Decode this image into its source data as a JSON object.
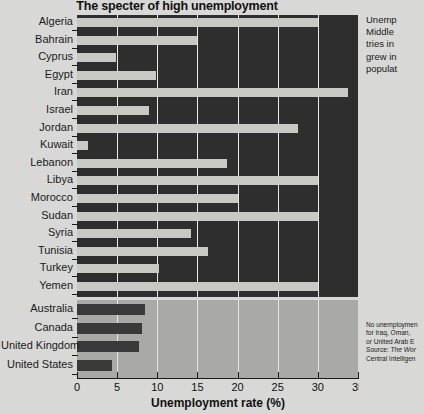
{
  "chart_data": {
    "type": "bar",
    "orientation": "horizontal",
    "title": "The specter of high unemployment",
    "xlabel": "Unemployment rate (%)",
    "ylabel": "",
    "xlim": [
      0,
      35
    ],
    "xticks": [
      0,
      5,
      10,
      15,
      20,
      25,
      30,
      35
    ],
    "xtick_labels": [
      "0",
      "5",
      "10",
      "15",
      "20",
      "25",
      "30",
      "35"
    ],
    "grid": true,
    "legend": "none",
    "panels": [
      {
        "name": "middle-east-north-africa",
        "background": "#2e2e2e",
        "bar_color": "#c9c9c4",
        "categories": [
          "Algeria",
          "Bahrain",
          "Cyprus",
          "Egypt",
          "Iran",
          "Israel",
          "Jordan",
          "Kuwait",
          "Lebanon",
          "Libya",
          "Morocco",
          "Sudan",
          "Syria",
          "Tunisia",
          "Turkey",
          "Yemen"
        ],
        "values": [
          30.0,
          15.0,
          4.8,
          9.8,
          33.8,
          9.0,
          27.5,
          1.4,
          18.7,
          30.0,
          20.0,
          30.0,
          14.2,
          16.3,
          10.2,
          30.0
        ]
      },
      {
        "name": "comparison-countries",
        "background": "#a9a9a7",
        "bar_color": "#3a3a3a",
        "categories": [
          "Australia",
          "Canada",
          "United Kingdom",
          "United States"
        ],
        "values": [
          8.5,
          8.1,
          7.7,
          4.4
        ]
      }
    ]
  },
  "side_note": {
    "lines": [
      "Unemp",
      "Middle",
      "tries in",
      "grew in",
      "populat"
    ]
  },
  "footnote": {
    "lines": [
      "No unemploymen",
      "for Iraq, Oman, ",
      "or United Arab E",
      "Source: The Wor",
      "Central Intelligen"
    ],
    "source_italic_line_index": 3
  },
  "colors": {
    "page_background": "#d8d8d6",
    "top_panel": "#2e2e2e",
    "bottom_panel": "#a9a9a7",
    "light_bar": "#c9c9c4",
    "dark_bar": "#3a3a3a",
    "gridline": "#e9e9e6",
    "text": "#1a1a1a"
  }
}
